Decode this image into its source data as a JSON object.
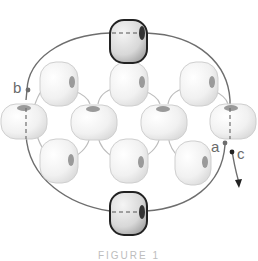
{
  "diagram": {
    "labels": {
      "a": "a",
      "b": "b",
      "c": "c"
    },
    "caption": "FIGURE 1",
    "colors": {
      "thread": "#6e6e6e",
      "bead_fill": "#f4f4f4",
      "bead_outline": "#c8c8c8",
      "accent_bead_outline": "#2a2a2a",
      "accent_bead_fill": "#d9d9d9",
      "label": "#6a6a6a"
    },
    "beads": {
      "accent": [
        {
          "id": "top",
          "cx": 128,
          "cy": 42
        },
        {
          "id": "bottom",
          "cx": 128,
          "cy": 212
        }
      ],
      "middle_row": [
        {
          "cx": 23,
          "cy": 118
        },
        {
          "cx": 93,
          "cy": 120
        },
        {
          "cx": 163,
          "cy": 120
        },
        {
          "cx": 232,
          "cy": 117
        }
      ],
      "upper_row": [
        {
          "cx": 58,
          "cy": 84
        },
        {
          "cx": 128,
          "cy": 84
        },
        {
          "cx": 198,
          "cy": 84
        }
      ],
      "lower_row": [
        {
          "cx": 58,
          "cy": 161
        },
        {
          "cx": 128,
          "cy": 161
        },
        {
          "cx": 192,
          "cy": 161
        }
      ]
    }
  }
}
